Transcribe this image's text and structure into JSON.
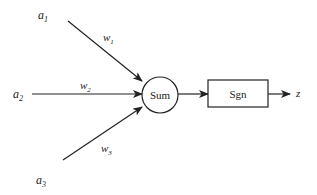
{
  "diagram": {
    "type": "perceptron",
    "colors": {
      "stroke": "#222222",
      "text": "#222222",
      "background": "#ffffff"
    },
    "inputs": [
      {
        "name": "a",
        "sub": "1",
        "weight": {
          "name": "w",
          "sub": "1"
        }
      },
      {
        "name": "a",
        "sub": "2",
        "weight": {
          "name": "w",
          "sub": "2"
        }
      },
      {
        "name": "a",
        "sub": "3",
        "weight": {
          "name": "w",
          "sub": "3"
        }
      }
    ],
    "sum_node": {
      "label": "Sum"
    },
    "activation_node": {
      "label": "Sgn"
    },
    "output": {
      "label": "z"
    }
  }
}
